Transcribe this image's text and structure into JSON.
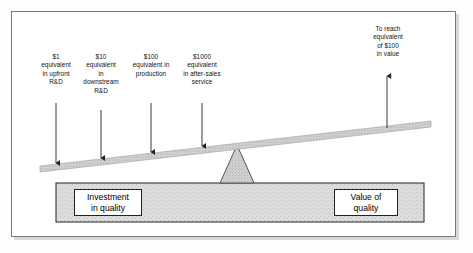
{
  "diagram": {
    "colors": {
      "frame_border": "#7a7a7a",
      "frame_background": "#ffffff",
      "beam_fill": "#c9c9c9",
      "beam_stroke": "#9a9a9a",
      "fulcrum_fill": "#d2d2d2",
      "fulcrum_stroke": "#4a4a4a",
      "base_fill": "#dcdcdc",
      "base_stroke": "#222222",
      "arrow_color": "#222222",
      "text_color": "#111111"
    },
    "callouts": [
      {
        "id": "upfront-rd",
        "amount": "$1",
        "text": "$1\nequivalent\nin upfront\nR&D"
      },
      {
        "id": "downstream-rd",
        "amount": "$10",
        "text": "$10\nequivalent\nin\ndownstream\nR&D"
      },
      {
        "id": "production",
        "amount": "$100",
        "text": "$100\nequivalent in\nproduction"
      },
      {
        "id": "after-sales-service",
        "amount": "$1000",
        "text": "$1000\nequivalent\nin after-sales\nservice"
      },
      {
        "id": "value-target",
        "amount": "$100",
        "text": "To reach\nequivalent\nof $100\nin value"
      }
    ],
    "boxes": {
      "investment": "Investment\nin quality",
      "value": "Value of\nquality"
    }
  }
}
